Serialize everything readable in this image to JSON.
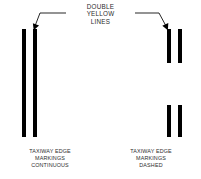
{
  "diagram": {
    "width": 201,
    "height": 179,
    "background": "#ffffff",
    "ink": "#000000",
    "text_color": "#2d2d2d",
    "callout": {
      "label": "DOUBLE\nYELLOW\nLINES",
      "lines": [
        "DOUBLE",
        "YELLOW",
        "LINES"
      ],
      "left_arrow_name": "leader-arrow-left",
      "right_arrow_name": "leader-arrow-right"
    },
    "groups": [
      {
        "id": "continuous",
        "caption": "TAXIWAY EDGE\nMARKINGS\nCONTINUOUS",
        "caption_lines": [
          "TAXIWAY EDGE",
          "MARKINGS",
          "CONTINUOUS"
        ],
        "style": "continuous",
        "bars": [
          {
            "x": 22,
            "y": 29,
            "w": 4,
            "h": 108
          },
          {
            "x": 33,
            "y": 29,
            "w": 4,
            "h": 108
          }
        ]
      },
      {
        "id": "dashed",
        "caption": "TAXIWAY EDGE\nMARKINGS\nDASHED",
        "caption_lines": [
          "TAXIWAY EDGE",
          "MARKINGS",
          "DASHED"
        ],
        "style": "dashed",
        "bars": [
          {
            "x": 167,
            "y": 29,
            "w": 4,
            "h": 34
          },
          {
            "x": 178,
            "y": 29,
            "w": 4,
            "h": 34
          },
          {
            "x": 167,
            "y": 105,
            "w": 4,
            "h": 32
          },
          {
            "x": 178,
            "y": 105,
            "w": 4,
            "h": 32
          }
        ]
      }
    ]
  }
}
